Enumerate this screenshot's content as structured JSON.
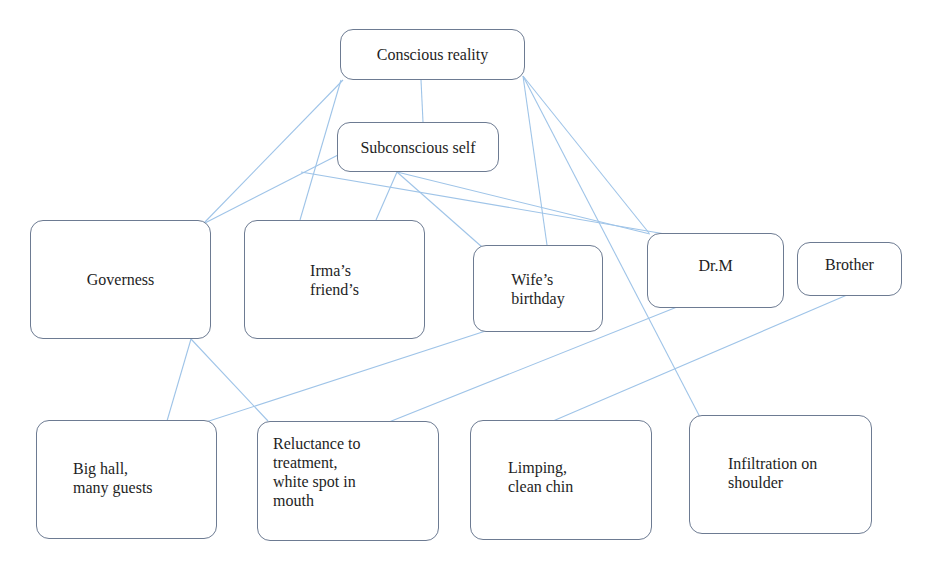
{
  "diagram": {
    "type": "concept-map",
    "colors": {
      "node_border": "#6d7b92",
      "edge": "#9fc4e8",
      "text": "#1e1e1e",
      "background": "#ffffff"
    },
    "nodes": {
      "conscious_reality": {
        "label": "Conscious reality"
      },
      "subconscious_self": {
        "label": "Subconscious self"
      },
      "governess": {
        "label": "Governess"
      },
      "irmas_friends": {
        "label": "Irma’s\nfriend’s"
      },
      "wifes_birthday": {
        "label": "Wife’s\nbirthday"
      },
      "dr_m": {
        "label": "Dr.M"
      },
      "brother": {
        "label": "Brother"
      },
      "big_hall": {
        "label": "Big hall,\nmany guests"
      },
      "reluctance": {
        "label": "Reluctance to\ntreatment,\nwhite spot in\nmouth"
      },
      "limping": {
        "label": "Limping,\nclean chin"
      },
      "infiltration": {
        "label": "Infiltration on\nshoulder"
      }
    },
    "edges": [
      {
        "from": "conscious_reality",
        "to": "subconscious_self"
      },
      {
        "from": "conscious_reality",
        "to": "governess"
      },
      {
        "from": "conscious_reality",
        "to": "irmas_friends"
      },
      {
        "from": "conscious_reality",
        "to": "wifes_birthday"
      },
      {
        "from": "conscious_reality",
        "to": "dr_m"
      },
      {
        "from": "conscious_reality",
        "to": "infiltration"
      },
      {
        "from": "subconscious_self",
        "to": "governess"
      },
      {
        "from": "subconscious_self",
        "to": "irmas_friends"
      },
      {
        "from": "subconscious_self",
        "to": "wifes_birthday"
      },
      {
        "from": "subconscious_self",
        "to": "dr_m"
      },
      {
        "from": "governess",
        "to": "big_hall"
      },
      {
        "from": "governess",
        "to": "reluctance"
      },
      {
        "from": "wifes_birthday",
        "to": "big_hall"
      },
      {
        "from": "dr_m",
        "to": "reluctance"
      },
      {
        "from": "brother",
        "to": "limping"
      }
    ]
  }
}
